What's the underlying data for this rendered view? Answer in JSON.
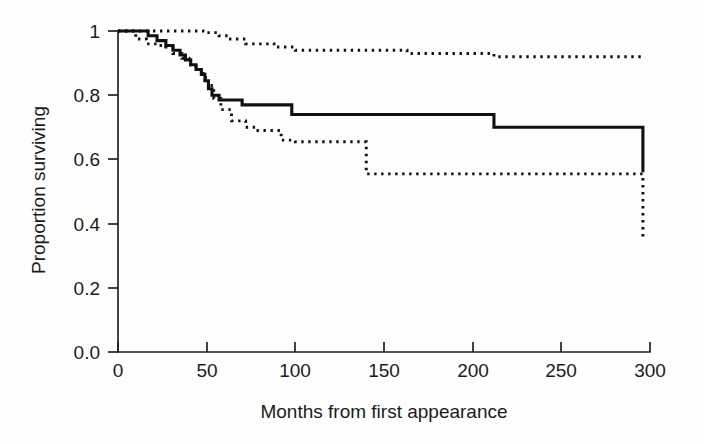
{
  "figure": {
    "title": "",
    "background": "#fefefe"
  },
  "axes": {
    "x": {
      "label": "Months from first appearance",
      "ticks": [
        0,
        50,
        100,
        150,
        200,
        250,
        300
      ],
      "tick_labels": [
        "0",
        "50",
        "100",
        "150",
        "200",
        "250",
        "300"
      ],
      "range": [
        0,
        300
      ],
      "pixel_origin": 118,
      "pixel_end": 650
    },
    "y": {
      "label": "Proportion surviving",
      "ticks": [
        0.0,
        0.2,
        0.4,
        0.6,
        0.8,
        1.0
      ],
      "tick_labels": [
        "0.0",
        "0.2",
        "0.4",
        "0.6",
        "0.8",
        "1.0"
      ],
      "range": [
        0.0,
        1.0
      ],
      "pixel_origin": 352,
      "pixel_end": 31
    }
  },
  "colors": {
    "line": "#101010",
    "axis": "#222222",
    "text": "#1b1b1b",
    "background": "#fefefe"
  },
  "chart_data": {
    "type": "line",
    "subtype": "kaplan-meier-survival",
    "title": "",
    "xlabel": "Months from first appearance",
    "ylabel": "Proportion surviving",
    "xlim": [
      0,
      300
    ],
    "ylim": [
      0.0,
      1.0
    ],
    "xticks": [
      0,
      50,
      100,
      150,
      200,
      250,
      300
    ],
    "yticks": [
      0.0,
      0.2,
      0.4,
      0.6,
      0.8,
      1.0
    ],
    "grid": false,
    "legend": "none",
    "series": [
      {
        "name": "Survival estimate",
        "style": "solid",
        "step": "post",
        "x": [
          0,
          12,
          17,
          22,
          27,
          31,
          35,
          38,
          41,
          44,
          47,
          49,
          51,
          53,
          57,
          62,
          70,
          93,
          98,
          140,
          212,
          296
        ],
        "y": [
          1.0,
          1.0,
          0.985,
          0.97,
          0.955,
          0.94,
          0.925,
          0.91,
          0.895,
          0.88,
          0.865,
          0.845,
          0.82,
          0.8,
          0.785,
          0.785,
          0.77,
          0.77,
          0.74,
          0.74,
          0.7,
          0.56
        ]
      },
      {
        "name": "Upper 95% confidence limit",
        "style": "dotted",
        "step": "post",
        "x": [
          0,
          14,
          44,
          50,
          57,
          62,
          72,
          88,
          100,
          140,
          163,
          212,
          296
        ],
        "y": [
          1.0,
          1.0,
          1.0,
          0.995,
          0.985,
          0.975,
          0.96,
          0.95,
          0.94,
          0.94,
          0.93,
          0.92,
          0.915
        ]
      },
      {
        "name": "Lower 95% confidence limit",
        "style": "dotted",
        "step": "post",
        "x": [
          0,
          10,
          16,
          22,
          27,
          31,
          36,
          40,
          44,
          48,
          51,
          54,
          58,
          64,
          72,
          78,
          92,
          100,
          140,
          212,
          296
        ],
        "y": [
          1.0,
          0.975,
          0.96,
          0.955,
          0.95,
          0.93,
          0.915,
          0.895,
          0.88,
          0.855,
          0.83,
          0.79,
          0.755,
          0.72,
          0.7,
          0.69,
          0.66,
          0.655,
          0.555,
          0.555,
          0.36
        ]
      }
    ],
    "annotations": []
  }
}
